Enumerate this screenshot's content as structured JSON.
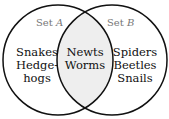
{
  "diagram": {
    "type": "venn",
    "sets": [
      {
        "name": "Set A",
        "label_prefix": "Set ",
        "label_var": "A",
        "only": [
          "Snakes",
          "Hedge-",
          "hogs"
        ]
      },
      {
        "name": "Set B",
        "label_prefix": "Set ",
        "label_var": "B",
        "only": [
          "Spiders",
          "Beetles",
          "Snails"
        ]
      }
    ],
    "intersection": [
      "Newts",
      "Worms"
    ],
    "colors": {
      "stroke": "#111111",
      "intersection_fill": "#eeeeee",
      "set_label": "#777777"
    }
  }
}
